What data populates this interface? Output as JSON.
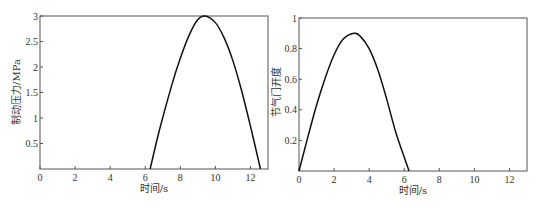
{
  "chart_data": [
    {
      "type": "line",
      "title": "",
      "xlabel": "时间/s",
      "ylabel": "制动压力/MPa",
      "xlim": [
        0,
        13
      ],
      "ylim": [
        0,
        3
      ],
      "xticks": [
        0,
        2,
        4,
        6,
        8,
        10,
        12
      ],
      "xtick_labels": [
        "0",
        "2",
        "4",
        "6",
        "8",
        "10",
        "12"
      ],
      "yticks": [
        0.5,
        1,
        1.5,
        2,
        2.5,
        3
      ],
      "ytick_labels": [
        "0.5",
        "1",
        "1.5",
        "2",
        "2.5",
        "3"
      ],
      "grid": false,
      "series": [
        {
          "name": "brake_pressure",
          "x": [
            6.28,
            6.8,
            7.5,
            8.0,
            8.5,
            9.0,
            9.42,
            10.0,
            10.5,
            11.0,
            11.5,
            12.0,
            12.57
          ],
          "y": [
            0.0,
            0.75,
            1.63,
            2.17,
            2.62,
            2.93,
            3.0,
            2.87,
            2.57,
            2.12,
            1.53,
            0.84,
            0.0
          ]
        }
      ]
    },
    {
      "type": "line",
      "title": "",
      "xlabel": "时间/s",
      "ylabel": "节气门开度",
      "xlim": [
        0,
        13
      ],
      "ylim": [
        0,
        1
      ],
      "xticks": [
        0,
        2,
        4,
        6,
        8,
        10,
        12
      ],
      "xtick_labels": [
        "0",
        "2",
        "4",
        "6",
        "8",
        "10",
        "12"
      ],
      "yticks": [
        0.2,
        0.4,
        0.6,
        0.8,
        1
      ],
      "ytick_labels": [
        "0.2",
        "0.4",
        "0.6",
        "0.8",
        "1"
      ],
      "grid": false,
      "series": [
        {
          "name": "throttle_opening",
          "x": [
            0.0,
            0.5,
            1.0,
            1.5,
            2.0,
            2.5,
            3.14,
            3.5,
            4.0,
            4.5,
            5.0,
            5.5,
            6.0,
            6.28
          ],
          "y": [
            0.0,
            0.22,
            0.43,
            0.61,
            0.76,
            0.86,
            0.9,
            0.88,
            0.8,
            0.66,
            0.47,
            0.26,
            0.09,
            0.0
          ]
        }
      ]
    }
  ],
  "charts": [
    {
      "xlabel": "时间/s",
      "ylabel": "制动压力/MPa",
      "origin_label": "0"
    },
    {
      "xlabel": "时间/s",
      "ylabel": "节气门开度",
      "origin_label": "0"
    }
  ]
}
